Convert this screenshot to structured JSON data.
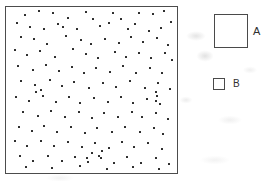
{
  "figure": {
    "background_color": "#ffffff"
  },
  "quadrat": {
    "name": "sample-plot",
    "border_color": "#4c4c4c",
    "fill_color": "#ffffff"
  },
  "legend": {
    "position": "right",
    "items": [
      {
        "label": "A",
        "size": "large",
        "swatch_px": 34,
        "fill": "#ffffff",
        "stroke": "#4a4a4a"
      },
      {
        "label": "B",
        "size": "small",
        "swatch_px": 12,
        "fill": "#ffffff",
        "stroke": "#4a4a4a"
      }
    ]
  },
  "chart_data": {
    "type": "scatter",
    "title": "",
    "subtitle": "",
    "xlabel": "",
    "ylabel": "",
    "xlim": [
      0,
      100
    ],
    "ylim": [
      0,
      100
    ],
    "grid": false,
    "legend_position": "right",
    "marker": {
      "shape": "square",
      "color": "#2b2b2b",
      "size_px": 2
    },
    "point_count": 148,
    "legend_entries": [
      "A",
      "B"
    ],
    "annotations": [],
    "series": [
      {
        "name": "points",
        "points": [
          [
            11.0,
            95.0
          ],
          [
            19.5,
            97.5
          ],
          [
            27.5,
            96.5
          ],
          [
            36.0,
            93.5
          ],
          [
            46.5,
            97.0
          ],
          [
            51.0,
            92.5
          ],
          [
            62.5,
            96.5
          ],
          [
            67.0,
            93.0
          ],
          [
            78.0,
            96.5
          ],
          [
            86.0,
            95.5
          ],
          [
            92.5,
            97.5
          ],
          [
            96.5,
            91.0
          ],
          [
            6.5,
            90.5
          ],
          [
            14.0,
            88.0
          ],
          [
            22.5,
            86.5
          ],
          [
            30.5,
            90.0
          ],
          [
            33.5,
            88.0
          ],
          [
            41.5,
            86.5
          ],
          [
            55.0,
            88.5
          ],
          [
            60.5,
            90.5
          ],
          [
            71.5,
            87.0
          ],
          [
            75.5,
            89.5
          ],
          [
            83.5,
            85.5
          ],
          [
            90.5,
            87.5
          ],
          [
            8.5,
            82.0
          ],
          [
            16.5,
            80.5
          ],
          [
            24.0,
            78.0
          ],
          [
            35.0,
            82.5
          ],
          [
            44.0,
            80.0
          ],
          [
            49.5,
            77.5
          ],
          [
            58.0,
            81.0
          ],
          [
            66.0,
            78.5
          ],
          [
            73.0,
            82.0
          ],
          [
            80.0,
            79.0
          ],
          [
            88.5,
            81.5
          ],
          [
            95.0,
            77.0
          ],
          [
            5.5,
            74.0
          ],
          [
            12.5,
            71.0
          ],
          [
            20.0,
            73.5
          ],
          [
            28.5,
            70.0
          ],
          [
            39.0,
            74.5
          ],
          [
            47.0,
            71.5
          ],
          [
            54.0,
            69.5
          ],
          [
            63.5,
            73.0
          ],
          [
            70.0,
            70.0
          ],
          [
            77.5,
            72.5
          ],
          [
            85.0,
            69.0
          ],
          [
            93.0,
            72.0
          ],
          [
            97.0,
            68.0
          ],
          [
            7.0,
            64.5
          ],
          [
            15.5,
            62.0
          ],
          [
            23.5,
            65.0
          ],
          [
            31.0,
            61.5
          ],
          [
            38.5,
            64.0
          ],
          [
            45.5,
            60.5
          ],
          [
            52.5,
            63.5
          ],
          [
            61.0,
            61.0
          ],
          [
            68.5,
            64.5
          ],
          [
            76.0,
            60.0
          ],
          [
            84.0,
            63.0
          ],
          [
            91.5,
            60.5
          ],
          [
            9.0,
            55.5
          ],
          [
            17.0,
            53.0
          ],
          [
            25.5,
            56.0
          ],
          [
            33.0,
            52.5
          ],
          [
            40.0,
            55.0
          ],
          [
            48.5,
            51.5
          ],
          [
            56.5,
            54.5
          ],
          [
            64.5,
            52.0
          ],
          [
            72.5,
            55.5
          ],
          [
            81.0,
            51.0
          ],
          [
            89.0,
            54.0
          ],
          [
            96.0,
            50.5
          ],
          [
            6.0,
            46.0
          ],
          [
            13.5,
            43.5
          ],
          [
            21.5,
            46.5
          ],
          [
            29.5,
            43.0
          ],
          [
            37.0,
            45.5
          ],
          [
            43.5,
            42.0
          ],
          [
            51.5,
            45.0
          ],
          [
            59.5,
            42.5
          ],
          [
            67.5,
            46.0
          ],
          [
            74.5,
            42.0
          ],
          [
            82.5,
            44.5
          ],
          [
            90.0,
            41.5
          ],
          [
            10.0,
            37.0
          ],
          [
            18.5,
            34.5
          ],
          [
            26.5,
            37.5
          ],
          [
            34.5,
            34.0
          ],
          [
            42.5,
            36.5
          ],
          [
            50.0,
            33.0
          ],
          [
            57.5,
            36.0
          ],
          [
            65.5,
            33.5
          ],
          [
            73.5,
            37.0
          ],
          [
            79.5,
            33.5
          ],
          [
            87.5,
            36.0
          ],
          [
            94.5,
            32.5
          ],
          [
            7.5,
            28.0
          ],
          [
            15.0,
            25.5
          ],
          [
            22.0,
            28.5
          ],
          [
            30.0,
            25.0
          ],
          [
            38.0,
            27.5
          ],
          [
            46.0,
            24.0
          ],
          [
            53.5,
            27.0
          ],
          [
            62.0,
            24.5
          ],
          [
            69.5,
            28.0
          ],
          [
            78.5,
            24.5
          ],
          [
            86.5,
            27.0
          ],
          [
            92.0,
            23.5
          ],
          [
            5.0,
            19.0
          ],
          [
            12.0,
            16.5
          ],
          [
            20.5,
            19.5
          ],
          [
            28.0,
            16.0
          ],
          [
            36.5,
            18.5
          ],
          [
            44.5,
            15.5
          ],
          [
            52.0,
            18.0
          ],
          [
            60.0,
            15.0
          ],
          [
            68.0,
            18.5
          ],
          [
            75.0,
            15.5
          ],
          [
            83.0,
            18.0
          ],
          [
            91.0,
            14.5
          ],
          [
            8.0,
            10.0
          ],
          [
            16.0,
            7.5
          ],
          [
            24.5,
            10.5
          ],
          [
            32.5,
            7.0
          ],
          [
            40.5,
            9.5
          ],
          [
            48.0,
            6.5
          ],
          [
            55.5,
            9.0
          ],
          [
            63.0,
            6.0
          ],
          [
            71.0,
            9.5
          ],
          [
            79.0,
            6.0
          ],
          [
            88.0,
            9.0
          ],
          [
            95.5,
            5.5
          ],
          [
            11.5,
            3.5
          ],
          [
            27.0,
            3.0
          ],
          [
            43.0,
            4.0
          ],
          [
            59.0,
            2.5
          ],
          [
            74.0,
            3.5
          ],
          [
            89.5,
            2.5
          ],
          [
            87.5,
            49.0
          ],
          [
            88.5,
            46.5
          ],
          [
            88.0,
            43.5
          ],
          [
            50.5,
            12.0
          ],
          [
            54.5,
            10.5
          ],
          [
            47.5,
            9.0
          ],
          [
            56.0,
            13.5
          ],
          [
            17.5,
            48.5
          ],
          [
            20.5,
            50.0
          ]
        ]
      }
    ]
  }
}
